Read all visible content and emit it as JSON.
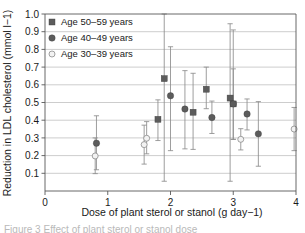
{
  "chart_data": {
    "type": "scatter",
    "title": "",
    "xlabel": "Dose of plant sterol or stanol (g day−1)",
    "ylabel": "Reduction in LDL cholesterol (mmol l−1)",
    "xlim": [
      0,
      4
    ],
    "ylim": [
      0,
      1.0
    ],
    "xticks": [
      "0",
      "1",
      "2",
      "3",
      "4"
    ],
    "xtick_values": [
      0,
      1,
      2,
      3,
      4
    ],
    "yticks": [
      "0.1",
      "0.2",
      "0.3",
      "0.4",
      "0.5",
      "0.6",
      "0.7",
      "0.8",
      "0.9",
      "1.0"
    ],
    "ytick_values": [
      0.1,
      0.2,
      0.3,
      0.4,
      0.5,
      0.6,
      0.7,
      0.8,
      0.9,
      1.0
    ],
    "grid": true,
    "grid_axis": "y",
    "legend_position": "top-left",
    "errorbars": "vertical 95% CI",
    "series": [
      {
        "name": "Age 50–59 years",
        "marker": "filled-square",
        "color": "#5c5c5c",
        "points": [
          {
            "x": 1.8,
            "y": 0.405,
            "lo": 0.285,
            "hi": 0.515
          },
          {
            "x": 1.9,
            "y": 0.635,
            "lo": 0.055,
            "hi": 1.0
          },
          {
            "x": 2.36,
            "y": 0.445,
            "lo": 0.235,
            "hi": 0.665
          },
          {
            "x": 2.57,
            "y": 0.575,
            "lo": 0.465,
            "hi": 0.7
          },
          {
            "x": 2.95,
            "y": 0.525,
            "lo": 0.055,
            "hi": 0.945
          },
          {
            "x": 3.0,
            "y": 0.492,
            "lo": 0.292,
            "hi": 0.69
          }
        ]
      },
      {
        "name": "Age 40–49 years",
        "marker": "filled-circle",
        "color": "#5c5c5c",
        "points": [
          {
            "x": 0.82,
            "y": 0.27,
            "lo": 0.12,
            "hi": 0.425
          },
          {
            "x": 2.0,
            "y": 0.538,
            "lo": 0.228,
            "hi": 0.815
          },
          {
            "x": 2.23,
            "y": 0.463,
            "lo": 0.238,
            "hi": 0.68
          },
          {
            "x": 2.66,
            "y": 0.415,
            "lo": 0.325,
            "hi": 0.508
          },
          {
            "x": 3.0,
            "y": 0.492,
            "lo": 0.292,
            "hi": 0.91
          },
          {
            "x": 3.22,
            "y": 0.435,
            "lo": 0.345,
            "hi": 0.52
          },
          {
            "x": 3.4,
            "y": 0.323,
            "lo": 0.14,
            "hi": 0.505
          }
        ]
      },
      {
        "name": "Age 30–39 years",
        "marker": "open-circle",
        "color": "#f2f2f2",
        "points": [
          {
            "x": 0.8,
            "y": 0.198,
            "lo": 0.098,
            "hi": 0.3
          },
          {
            "x": 1.58,
            "y": 0.262,
            "lo": 0.152,
            "hi": 0.372
          },
          {
            "x": 1.62,
            "y": 0.298,
            "lo": 0.21,
            "hi": 0.392
          },
          {
            "x": 3.12,
            "y": 0.292,
            "lo": 0.232,
            "hi": 0.352
          },
          {
            "x": 3.97,
            "y": 0.35,
            "lo": 0.228,
            "hi": 0.472
          }
        ]
      }
    ]
  },
  "legend": {
    "items": [
      {
        "label": "Age 50–59 years",
        "marker": "filled-square"
      },
      {
        "label": "Age 40–49 years",
        "marker": "filled-circle"
      },
      {
        "label": "Age 30–39 years",
        "marker": "open-circle"
      }
    ]
  },
  "caption": {
    "text": "Figure 3   Effect of plant sterol or stanol dose"
  }
}
